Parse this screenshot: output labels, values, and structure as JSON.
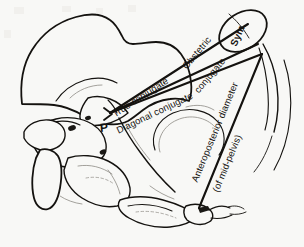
{
  "figure": {
    "background_color": "#f8f8f6",
    "ink_color": "#14120f",
    "faint_ink_color": "#8d8a84"
  },
  "labels": {
    "symphysis": "Sym.",
    "promontory_marker": "P",
    "true_conjugate": "True conjugate",
    "obstetric_conjugate_line1": "Obstetric",
    "obstetric_conjugate_line2": "conjugate",
    "diagonal_conjugate": "Diagonal conjugate",
    "ap_diameter_line1": "Anteroposterior diameter",
    "ap_diameter_line2": "(of mid-pelvis)"
  },
  "measurement_lines": [
    {
      "name": "true-conjugate",
      "label": "True conjugate",
      "from": "sacral promontory",
      "to": "upper inner border of symphysis pubis",
      "x1": 110,
      "y1": 113,
      "x2": 248,
      "y2": 24
    },
    {
      "name": "obstetric-conjugate",
      "label": "Obstetric conjugate",
      "from": "sacral promontory",
      "to": "innermost point of symphysis pubis",
      "x1": 110,
      "y1": 113,
      "x2": 258,
      "y2": 44
    },
    {
      "name": "diagonal-conjugate",
      "label": "Diagonal conjugate",
      "from": "sacral promontory",
      "to": "lower border of symphysis pubis",
      "x1": 110,
      "y1": 113,
      "x2": 262,
      "y2": 54
    },
    {
      "name": "anteroposterior-diameter-mid-pelvis",
      "label": "Anteroposterior diameter (of mid-pelvis)",
      "from": "lower border of symphysis pubis",
      "to": "sacrococcygeal region",
      "x1": 262,
      "y1": 54,
      "x2": 199,
      "y2": 208
    }
  ],
  "anatomy": [
    {
      "name": "ilium",
      "note": "large wing-shaped outline, upper left"
    },
    {
      "name": "symphysis-pubis",
      "note": "oval at upper right, labelled Sym."
    },
    {
      "name": "sacral-promontory",
      "note": "point labelled P"
    },
    {
      "name": "sacrum",
      "note": "segmented vertebral column, lower left to centre"
    },
    {
      "name": "coccyx",
      "note": "small terminal segments, lower right"
    },
    {
      "name": "acetabulum",
      "note": "faint circular outline in centre"
    },
    {
      "name": "ischial-spine",
      "note": "projection below promontory"
    }
  ]
}
